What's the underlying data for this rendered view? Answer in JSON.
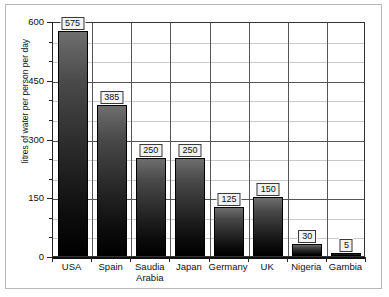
{
  "chart_data": {
    "type": "bar",
    "title": "",
    "xlabel": "",
    "ylabel": "litres of water per person per day",
    "categories": [
      "USA",
      "Spain",
      "Saudia Arabia",
      "Japan",
      "Germany",
      "UK",
      "Nigeria",
      "Gambia"
    ],
    "values": [
      575,
      385,
      250,
      250,
      125,
      150,
      30,
      5
    ],
    "value_labels": [
      "575",
      "385",
      "250",
      "250",
      "125",
      "150",
      "30",
      "5"
    ],
    "ylim": [
      0,
      600
    ],
    "ytick_labels": [
      "0",
      "150",
      "300",
      "450",
      "600"
    ],
    "ytick_values": [
      0,
      150,
      300,
      450,
      600
    ],
    "minor_tick_step": 50,
    "grid": "horizontal-and-vertical",
    "legend": "none",
    "bar_color_top": "#6e6e6e",
    "bar_color_bottom": "#000000",
    "grid_color": "#c9c9c9",
    "major_grid_color": "#555555",
    "axis_color": "#222222",
    "background": "#ffffff",
    "frame_color": "#b9b9b9"
  }
}
